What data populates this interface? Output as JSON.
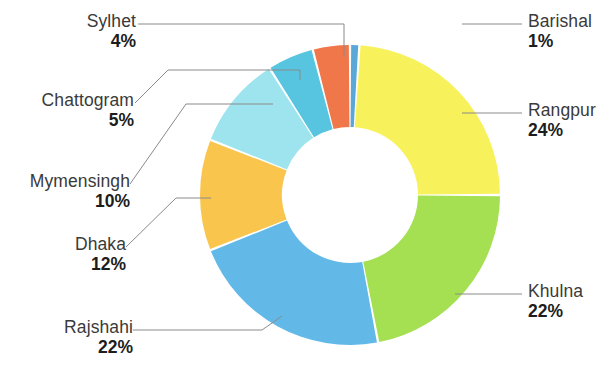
{
  "chart_data": {
    "type": "pie",
    "variant": "donut",
    "title": "",
    "subtitle": "",
    "xlabel": "",
    "ylabel": "",
    "legend_position": "callout-labels",
    "grid": false,
    "value_unit": "percent",
    "labels": [
      "Barishal",
      "Rangpur",
      "Khulna",
      "Rajshahi",
      "Dhaka",
      "Mymensingh",
      "Chattogram",
      "Sylhet"
    ],
    "values": [
      1,
      24,
      22,
      22,
      12,
      10,
      5,
      4
    ],
    "value_texts": [
      "1%",
      "24%",
      "22%",
      "22%",
      "12%",
      "10%",
      "5%",
      "4%"
    ],
    "colors": [
      "#5AA8D8",
      "#F7F25C",
      "#A5E053",
      "#62B9E8",
      "#F9C54D",
      "#9DE4EE",
      "#58C5E0",
      "#F0774A"
    ],
    "start_angle_deg": 0,
    "direction": "clockwise",
    "slices": [
      {
        "label": "Barishal",
        "value": 1,
        "value_text": "1%",
        "color": "#5AA8D8",
        "side": "right"
      },
      {
        "label": "Rangpur",
        "value": 24,
        "value_text": "24%",
        "color": "#F7F25C",
        "side": "right"
      },
      {
        "label": "Khulna",
        "value": 22,
        "value_text": "22%",
        "color": "#A5E053",
        "side": "right"
      },
      {
        "label": "Rajshahi",
        "value": 22,
        "value_text": "22%",
        "color": "#62B9E8",
        "side": "left"
      },
      {
        "label": "Dhaka",
        "value": 12,
        "value_text": "12%",
        "color": "#F9C54D",
        "side": "left"
      },
      {
        "label": "Mymensingh",
        "value": 10,
        "value_text": "10%",
        "color": "#9DE4EE",
        "side": "left"
      },
      {
        "label": "Chattogram",
        "value": 5,
        "value_text": "5%",
        "color": "#58C5E0",
        "side": "left"
      },
      {
        "label": "Sylhet",
        "value": 4,
        "value_text": "4%",
        "color": "#F0774A",
        "side": "left"
      }
    ]
  },
  "callouts": {
    "sylhet": {
      "name": "Sylhet",
      "pct": "4%"
    },
    "chattogram": {
      "name": "Chattogram",
      "pct": "5%"
    },
    "mymensingh": {
      "name": "Mymensingh",
      "pct": "10%"
    },
    "dhaka": {
      "name": "Dhaka",
      "pct": "12%"
    },
    "rajshahi": {
      "name": "Rajshahi",
      "pct": "22%"
    },
    "barishal": {
      "name": "Barishal",
      "pct": "1%"
    },
    "rangpur": {
      "name": "Rangpur",
      "pct": "24%"
    },
    "khulna": {
      "name": "Khulna",
      "pct": "22%"
    }
  },
  "style": {
    "background": "#FFFFFF",
    "leader_line_color": "#8A8A8A",
    "label_text_color": "#3A3A3A",
    "value_text_color": "#1D1D1D"
  }
}
